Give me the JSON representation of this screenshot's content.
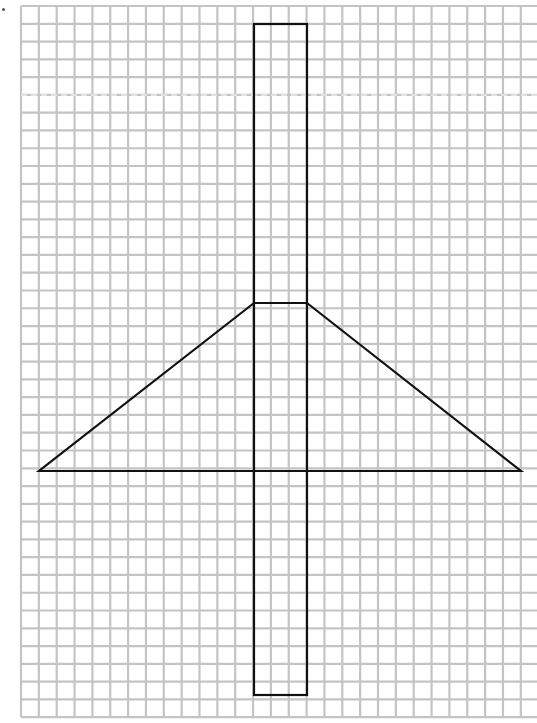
{
  "diagram": {
    "type": "grid-paper-drawing",
    "canvas": {
      "width": 537,
      "height": 723
    },
    "grid": {
      "origin_x": 21,
      "origin_y": 6,
      "end_x": 537,
      "end_y": 717,
      "pitch_x": 17.85,
      "pitch_y": 17.78,
      "line_color": "#c4c4c4",
      "line_width": 2.2
    },
    "shapes": [
      {
        "name": "vertical-rectangle",
        "kind": "rect",
        "x": 254,
        "y": 24,
        "width": 53,
        "height": 671,
        "stroke": "#111111",
        "stroke_width": 2.2
      },
      {
        "name": "trapezoid-triangle",
        "kind": "polygon",
        "points": [
          [
            254,
            303
          ],
          [
            307,
            303
          ],
          [
            521,
            471
          ],
          [
            39,
            471
          ]
        ],
        "stroke": "#111111",
        "stroke_width": 2.2
      }
    ],
    "artifacts": {
      "faint_dashed_line_y": 95,
      "corner_mark": true
    }
  }
}
